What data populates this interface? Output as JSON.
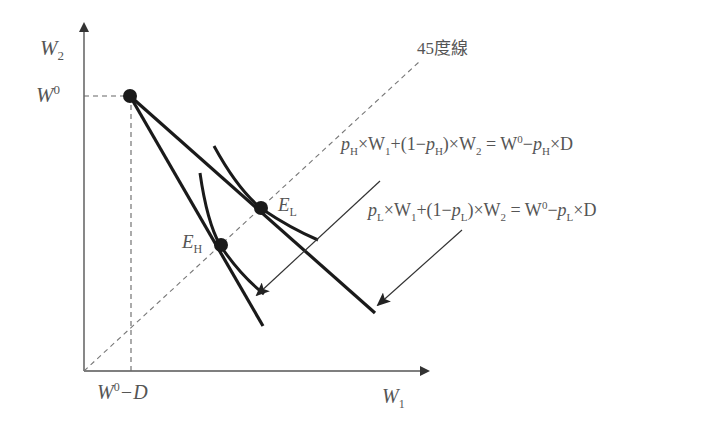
{
  "diagram": {
    "axes": {
      "y_label_main": "W",
      "y_label_sub": "2",
      "x_label_main": "W",
      "x_label_sub": "1"
    },
    "labels": {
      "w0_main": "W",
      "w0_sup": "0",
      "w0_minus_d_main": "W",
      "w0_minus_d_sup": "0",
      "w0_minus_d_rest": "−D",
      "line45": "45度線",
      "eL_main": "E",
      "eL_sub": "L",
      "eH_main": "E",
      "eH_sub": "H"
    },
    "equations": {
      "high": {
        "p": "p",
        "sub": "H",
        "t1": "×W",
        "s1": "1",
        "t2": "+(1−",
        "p2": "p",
        "sub2": "H",
        "t3": ")×W",
        "s3": "2",
        "t4": " = W",
        "sup4": "0",
        "t5": "−",
        "p5": "p",
        "sub5": "H",
        "t6": "×D"
      },
      "low": {
        "p": "p",
        "sub": "L",
        "t1": "×W",
        "s1": "1",
        "t2": "+(1−",
        "p2": "p",
        "sub2": "L",
        "t3": ")×W",
        "s3": "2",
        "t4": " = W",
        "sup4": "0",
        "t5": "−",
        "p5": "p",
        "sub5": "L",
        "t6": "×D"
      }
    },
    "colors": {
      "axis": "#555555",
      "line": "#1a1a1a",
      "dashed": "#777777",
      "text": "#555555"
    }
  }
}
